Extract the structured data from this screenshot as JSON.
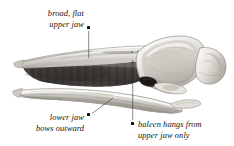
{
  "figure": {
    "style": "grayscale scientific engraving",
    "background_color": "#ffffff",
    "ink_color": "#111111",
    "baleen_color": "#4a4a4a",
    "bone_color": "#d8d5d0"
  },
  "annotations": [
    {
      "id": "upper-jaw",
      "lines": [
        "broad, flat",
        "upper jaw"
      ],
      "text": "broad, flat upper jaw",
      "align": "right",
      "text_x": 34,
      "text_y": 9,
      "text_width": 50,
      "bullet_x": 87,
      "bullet_y": 26,
      "leader": {
        "x1": 88.7,
        "y1": 31,
        "x2": 88.7,
        "y2": 58
      }
    },
    {
      "id": "lower-jaw",
      "lines": [
        "lower jaw",
        "bows outward"
      ],
      "text": "lower jaw bows outward",
      "align": "right",
      "text_x": 30,
      "text_y": 113,
      "text_width": 54,
      "bullet_x": 87,
      "bullet_y": 113,
      "leader": {
        "x1": 92,
        "y1": 113.5,
        "x2": 113,
        "y2": 98
      }
    },
    {
      "id": "baleen",
      "lines": [
        "baleen hangs from",
        "upper jaw only"
      ],
      "text": "baleen hangs from upper jaw only",
      "align": "left",
      "text_x": 138,
      "text_y": 120,
      "text_width": 90,
      "bullet_x": 131,
      "bullet_y": 122,
      "leader": {
        "x1": 132.7,
        "y1": 60,
        "x2": 132.7,
        "y2": 120
      }
    }
  ]
}
